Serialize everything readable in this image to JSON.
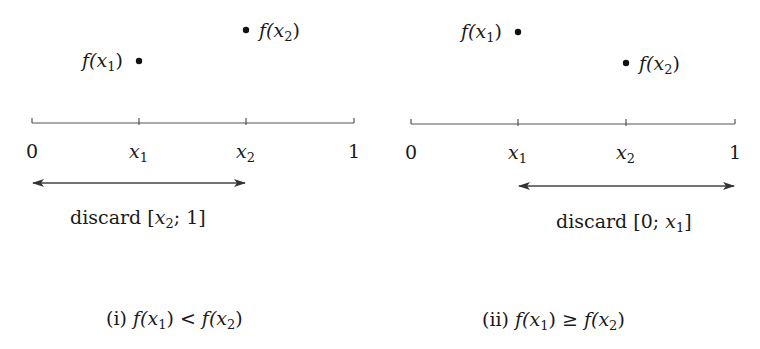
{
  "panels": [
    {
      "id": "i",
      "axis": {
        "tick_labels": [
          "0",
          "x1",
          "x2",
          "1"
        ]
      },
      "points": [
        {
          "label": "f(x1)",
          "x": "x1",
          "relative_height": "lower"
        },
        {
          "label": "f(x2)",
          "x": "x2",
          "relative_height": "higher"
        }
      ],
      "arrow": {
        "from": "0",
        "to": "x2",
        "label": "discard [x2; 1]"
      },
      "caption": "(i) f(x1) < f(x2)"
    },
    {
      "id": "ii",
      "axis": {
        "tick_labels": [
          "0",
          "x1",
          "x2",
          "1"
        ]
      },
      "points": [
        {
          "label": "f(x1)",
          "x": "x1",
          "relative_height": "higher"
        },
        {
          "label": "f(x2)",
          "x": "x2",
          "relative_height": "lower"
        }
      ],
      "arrow": {
        "from": "x1",
        "to": "1",
        "label": "discard [0; x1]"
      },
      "caption": "(ii) f(x1) ≥ f(x2)"
    }
  ],
  "text": {
    "zero": "0",
    "one": "1",
    "x": "x",
    "f_open": "f(",
    "close": ")",
    "sub1": "1",
    "sub2": "2",
    "discard": "discard",
    "cap_i": "(i)",
    "cap_ii": "(ii)",
    "lt": "<",
    "ge": "≥",
    "bracket_open": "[",
    "bracket_close": "]",
    "semi": ";"
  },
  "colors": {
    "ink": "#1a1a1a",
    "line": "#555555"
  }
}
